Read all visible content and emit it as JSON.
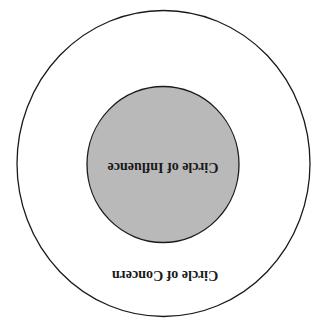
{
  "diagram": {
    "orientation": "rotated-180",
    "outer_circle": {
      "label": "Circle of Concern",
      "fill": "#ffffff",
      "stroke": "#1a1a1a"
    },
    "inner_circle": {
      "label": "Circle of Influence",
      "fill": "#b9b9b9",
      "stroke": "#1a1a1a"
    }
  }
}
